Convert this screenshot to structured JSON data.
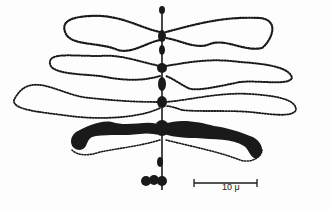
{
  "figure": {
    "scale_bar": {
      "label": "10 μ",
      "x1": 194,
      "x2": 257,
      "y": 183
    },
    "colors": {
      "ink": "#1a1a1a",
      "background": "#fdfdfd"
    }
  }
}
